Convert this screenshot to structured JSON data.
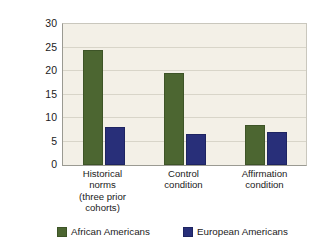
{
  "chart_data": {
    "type": "bar",
    "title": "",
    "subtitle": "",
    "xlabel": "",
    "ylabel": "Percentage of students earning a D or below in course",
    "ylabel_lines": [
      "Percentage of students earning",
      "a D or below in course"
    ],
    "categories": [
      "Historical norms (three prior cohorts)",
      "Control condition",
      "Affirmation condition"
    ],
    "category_lines": [
      [
        "Historical",
        "norms",
        "(three prior",
        "cohorts)"
      ],
      [
        "Control",
        "condition"
      ],
      [
        "Affirmation",
        "condition"
      ]
    ],
    "series": [
      {
        "name": "African Americans",
        "color": "#4c6631",
        "values": [
          24.5,
          19.6,
          8.6
        ]
      },
      {
        "name": "European Americans",
        "color": "#282f79",
        "values": [
          8.0,
          6.6,
          7.0
        ]
      }
    ],
    "ylim": [
      0,
      30
    ],
    "yticks": [
      0,
      5,
      10,
      15,
      20,
      25,
      30
    ],
    "ytick_labels": [
      "0",
      "5",
      "10",
      "15",
      "20",
      "25",
      "30"
    ],
    "grid": true,
    "grid_axis": "y",
    "legend_position": "bottom",
    "plot_background": "#f3f0e7",
    "figure_background": "#ffffff"
  },
  "legend": {
    "items": [
      {
        "label": "African Americans",
        "color": "#4c6631"
      },
      {
        "label": "European Americans",
        "color": "#282f79"
      }
    ]
  }
}
